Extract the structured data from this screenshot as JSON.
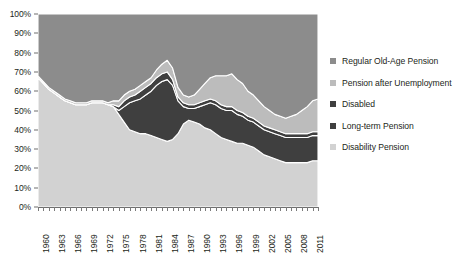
{
  "chart_data": {
    "type": "area",
    "stacked": true,
    "normalized": "100%",
    "title": "",
    "xlabel": "",
    "ylabel": "",
    "ylim": [
      0,
      100
    ],
    "ytick_labels": [
      "100%",
      "90%",
      "80%",
      "70%",
      "60%",
      "50%",
      "40%",
      "30%",
      "20%",
      "10%",
      "0%"
    ],
    "ytick_values": [
      100,
      90,
      80,
      70,
      60,
      50,
      40,
      30,
      20,
      10,
      0
    ],
    "grid": false,
    "legend_position": "right",
    "xlim": [
      1960,
      2012
    ],
    "xtick_labels": [
      "1960",
      "1963",
      "1966",
      "1969",
      "1972",
      "1975",
      "1978",
      "1981",
      "1984",
      "1987",
      "1990",
      "1993",
      "1996",
      "1999",
      "2002",
      "2005",
      "2008",
      "2011"
    ],
    "x": [
      1960,
      1961,
      1962,
      1963,
      1964,
      1965,
      1966,
      1967,
      1968,
      1969,
      1970,
      1971,
      1972,
      1973,
      1974,
      1975,
      1976,
      1977,
      1978,
      1979,
      1980,
      1981,
      1982,
      1983,
      1984,
      1985,
      1986,
      1987,
      1988,
      1989,
      1990,
      1991,
      1992,
      1993,
      1994,
      1995,
      1996,
      1997,
      1998,
      1999,
      2000,
      2001,
      2002,
      2003,
      2004,
      2005,
      2006,
      2007,
      2008,
      2009,
      2010,
      2011,
      2012
    ],
    "series": [
      {
        "name": "Disability Pension",
        "color": "#d2d2d2",
        "values": [
          67,
          64,
          61,
          59,
          57,
          55,
          54,
          53,
          53,
          53,
          54,
          54,
          54,
          53,
          52,
          48,
          44,
          40,
          39,
          38,
          38,
          37,
          36,
          35,
          34,
          35,
          38,
          43,
          45,
          44,
          43,
          41,
          40,
          38,
          36,
          35,
          34,
          33,
          33,
          32,
          31,
          29,
          27,
          26,
          25,
          24,
          23,
          23,
          23,
          23,
          23,
          24,
          24
        ]
      },
      {
        "name": "Long-term Pension",
        "color": "#3f3f3f",
        "values": [
          0,
          0,
          0,
          0,
          0,
          0,
          0,
          0,
          0,
          0,
          0,
          0,
          0,
          0,
          0,
          2,
          8,
          14,
          16,
          18,
          20,
          23,
          27,
          30,
          32,
          28,
          17,
          9,
          6,
          7,
          9,
          12,
          14,
          15,
          15,
          15,
          16,
          15,
          14,
          13,
          13,
          13,
          13,
          13,
          13,
          13,
          13,
          13,
          13,
          13,
          13,
          13,
          13
        ]
      },
      {
        "name": "Disabled",
        "color": "#3f3f3f",
        "values": [
          0,
          0,
          0,
          0,
          0,
          0,
          0,
          0,
          0,
          0,
          0,
          0,
          0,
          0,
          1,
          2,
          3,
          3,
          3,
          4,
          4,
          4,
          4,
          4,
          4,
          3,
          2,
          2,
          2,
          2,
          2,
          2,
          2,
          2,
          2,
          2,
          2,
          2,
          2,
          2,
          2,
          2,
          2,
          2,
          2,
          2,
          2,
          2,
          2,
          2,
          2,
          2,
          2
        ]
      },
      {
        "name": "Pension after Unemployment",
        "color": "#bcbcbc",
        "values": [
          1,
          1,
          1,
          1,
          1,
          1,
          1,
          1,
          1,
          1,
          1,
          1,
          1,
          1,
          2,
          3,
          3,
          3,
          3,
          3,
          3,
          3,
          4,
          5,
          6,
          6,
          5,
          4,
          4,
          5,
          7,
          9,
          11,
          13,
          15,
          16,
          17,
          16,
          15,
          13,
          12,
          11,
          10,
          9,
          8,
          8,
          8,
          9,
          10,
          12,
          14,
          16,
          17
        ]
      },
      {
        "name": "Regular Old-Age Pension",
        "color": "#8c8c8c",
        "values": [
          32,
          35,
          38,
          40,
          42,
          44,
          45,
          46,
          46,
          46,
          45,
          45,
          45,
          46,
          45,
          45,
          42,
          40,
          39,
          37,
          35,
          33,
          29,
          26,
          24,
          28,
          38,
          42,
          43,
          42,
          39,
          36,
          33,
          32,
          32,
          32,
          31,
          34,
          36,
          40,
          42,
          45,
          48,
          50,
          52,
          53,
          54,
          53,
          52,
          50,
          48,
          45,
          44
        ]
      }
    ]
  },
  "legend": {
    "items": [
      {
        "label": "Regular Old-Age Pension",
        "color": "#8c8c8c"
      },
      {
        "label": "Pension after Unemployment",
        "color": "#bcbcbc"
      },
      {
        "label": "Disabled",
        "color": "#3f3f3f"
      },
      {
        "label": "Long-term Pension",
        "color": "#3f3f3f"
      },
      {
        "label": "Disability Pension",
        "color": "#d2d2d2"
      }
    ]
  },
  "caption": {
    "text": ""
  }
}
